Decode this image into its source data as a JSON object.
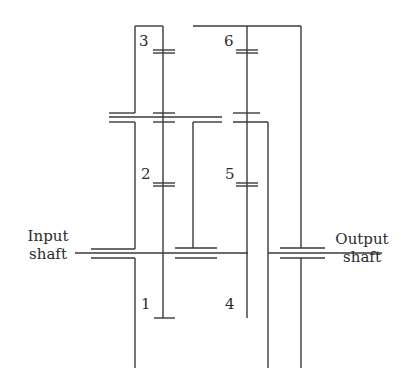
{
  "diagram": {
    "type": "gear-train-schematic",
    "gear_labels": [
      "1",
      "2",
      "3",
      "4",
      "5",
      "6"
    ],
    "input_label_line1": "Input",
    "input_label_line2": "shaft",
    "output_label_line1": "Output",
    "output_label_line2": "shaft",
    "line_color": "#3a3a3a"
  }
}
